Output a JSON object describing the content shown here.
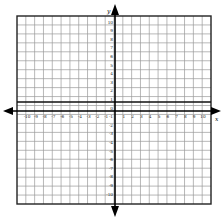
{
  "diagram": {
    "type": "coordinate-plane",
    "x_axis": {
      "label": "x",
      "min": -10,
      "max": 10,
      "tick_labels": [
        "-10",
        "-9",
        "-8",
        "-7",
        "-6",
        "-5",
        "-4",
        "-3",
        "-2",
        "-1",
        "1",
        "2",
        "3",
        "4",
        "5",
        "6",
        "7",
        "8",
        "9",
        "10"
      ]
    },
    "y_axis": {
      "label": "y",
      "min": -10,
      "max": 10,
      "tick_labels_positive": [
        "10",
        "9",
        "8",
        "7",
        "6",
        "5",
        "4",
        "3",
        "2",
        "1"
      ],
      "origin_label": "0",
      "tick_labels_negative": [
        "-1",
        "-2",
        "-3",
        "-4",
        "-5",
        "-6",
        "-7",
        "-8",
        "-9",
        "-10"
      ]
    },
    "grid": {
      "columns": 22,
      "rows": 21,
      "line_color": "#9a9a9a",
      "axis_color": "#000000",
      "border_color": "#222222"
    }
  }
}
